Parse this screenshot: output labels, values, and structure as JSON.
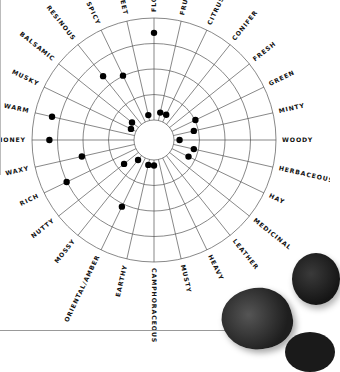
{
  "chart_data": {
    "type": "radar-dot",
    "title": "",
    "center": [
      154,
      140
    ],
    "inner_radius": 20,
    "outer_radius": 122,
    "rings": 4,
    "ring_levels": [
      0,
      1,
      2,
      3,
      4
    ],
    "categories": [
      "FLORAL",
      "FRUITY",
      "CITRUS",
      "CONIFER",
      "FRESH",
      "GREEN",
      "MINTY",
      "WOODY",
      "HERBACEOUS",
      "HAY",
      "MEDICINAL",
      "LEATHER",
      "HEAVY",
      "MUSTY",
      "CAMPHORACEOUS",
      "EARTHY",
      "ORIENTAL/AMBER",
      "MOSSY",
      "NUTTY",
      "RICH",
      "WAXY",
      "HONEY",
      "WARM",
      "MUSKY",
      "BALSAMIC",
      "RESINOUS",
      "SPICY",
      "SWEET"
    ],
    "values": [
      3.3,
      0.2,
      0.2,
      null,
      null,
      0.9,
      0.7,
      0.1,
      0.7,
      0.6,
      null,
      null,
      null,
      null,
      0.1,
      0.1,
      2.0,
      0.1,
      0.6,
      2.9,
      2.0,
      3.2,
      3.2,
      0.1,
      0.2,
      2.3,
      1.9,
      0.1
    ],
    "value_note": "Dot distance from inner circle measured in ring bands (0 = on inner circle, 4 = outer edge); null = no dot",
    "legend": [],
    "grid": true
  },
  "decor": {
    "left_rule": true,
    "bottom_rule": true,
    "petal_color": "#2a2a2a"
  }
}
